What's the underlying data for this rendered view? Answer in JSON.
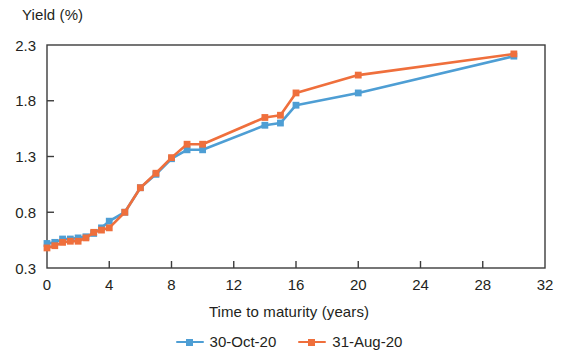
{
  "chart_data": {
    "type": "line",
    "title": "",
    "ylabel": "Yield (%)",
    "xlabel": "Time to maturity (years)",
    "xlim": [
      0,
      32
    ],
    "ylim": [
      0.3,
      2.3
    ],
    "xticks": [
      0,
      4,
      8,
      12,
      16,
      20,
      24,
      28,
      32
    ],
    "xtick_labels": [
      "0",
      "4",
      "8",
      "12",
      "16",
      "20",
      "24",
      "28",
      "32"
    ],
    "yticks": [
      0.3,
      0.8,
      1.3,
      1.8,
      2.3
    ],
    "ytick_labels": [
      "0.3",
      "0.8",
      "1.3",
      "1.8",
      "2.3"
    ],
    "grid": false,
    "legend_position": "bottom-center",
    "series": [
      {
        "name": "30-Oct-20",
        "color": "#4e9ed4",
        "marker": "square",
        "x": [
          0,
          0.5,
          1,
          1.5,
          2,
          2.5,
          3,
          3.5,
          4,
          5,
          6,
          7,
          8,
          9,
          10,
          14,
          15,
          16,
          20,
          30
        ],
        "values": [
          0.52,
          0.53,
          0.56,
          0.56,
          0.57,
          0.58,
          0.61,
          0.66,
          0.72,
          0.8,
          1.02,
          1.14,
          1.28,
          1.36,
          1.36,
          1.58,
          1.6,
          1.76,
          1.87,
          2.2
        ]
      },
      {
        "name": "31-Aug-20",
        "color": "#ef6f3c",
        "marker": "square",
        "x": [
          0,
          0.5,
          1,
          1.5,
          2,
          2.5,
          3,
          3.5,
          4,
          5,
          6,
          7,
          8,
          9,
          10,
          14,
          15,
          16,
          20,
          30
        ],
        "values": [
          0.48,
          0.5,
          0.53,
          0.54,
          0.54,
          0.57,
          0.62,
          0.64,
          0.66,
          0.8,
          1.02,
          1.15,
          1.29,
          1.41,
          1.41,
          1.65,
          1.67,
          1.87,
          2.03,
          2.22
        ]
      }
    ]
  },
  "axes": {
    "y_title": "Yield (%)",
    "x_title": "Time to maturity (years)"
  },
  "legend": {
    "items": [
      {
        "label": "30-Oct-20",
        "color": "#4e9ed4"
      },
      {
        "label": "31-Aug-20",
        "color": "#ef6f3c"
      }
    ]
  },
  "colors": {
    "series_blue": "#4e9ed4",
    "series_orange": "#ef6f3c",
    "axis": "#3c3c3c",
    "text": "#231f20"
  }
}
